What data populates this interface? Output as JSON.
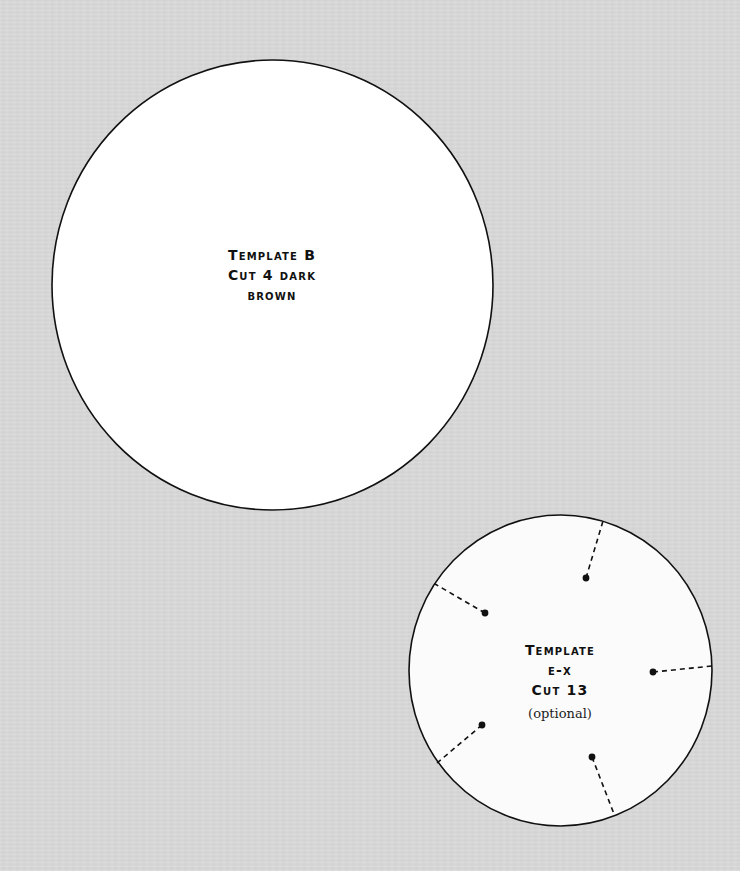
{
  "page": {
    "background": "#d8d8d8"
  },
  "templates": [
    {
      "id": "template-b",
      "lines": [
        "Template B",
        "Cut 4 dark",
        "brown"
      ],
      "fill": "#ffffff",
      "stroke": "#111111"
    },
    {
      "id": "template-e-x",
      "lines": [
        "Template",
        "e-x",
        "Cut 13"
      ],
      "note": "(optional)",
      "fill": "#fbfbfb",
      "stroke": "#111111",
      "markers": 5
    }
  ]
}
